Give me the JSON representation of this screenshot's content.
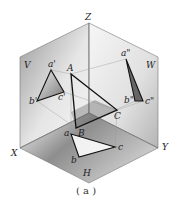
{
  "diagram": {
    "caption": "( a )",
    "axes": {
      "x": "X",
      "y": "Y",
      "z": "Z"
    },
    "planes": {
      "v": "V",
      "w": "W",
      "h": "H"
    },
    "space_points": {
      "a": "A",
      "b": "B",
      "c": "C"
    },
    "v_projection": {
      "a": "a'",
      "b": "b'",
      "c": "c'"
    },
    "w_projection": {
      "a": "a\"",
      "b": "b\"",
      "c": "c\""
    },
    "h_projection": {
      "a": "a",
      "b": "b",
      "c": "c"
    },
    "colors": {
      "line": "#111111",
      "plane_edge": "#777777",
      "v_plane": "#cfcfcf",
      "w_plane": "#d8d8d8",
      "h_plane": "#8a8a8a"
    }
  }
}
